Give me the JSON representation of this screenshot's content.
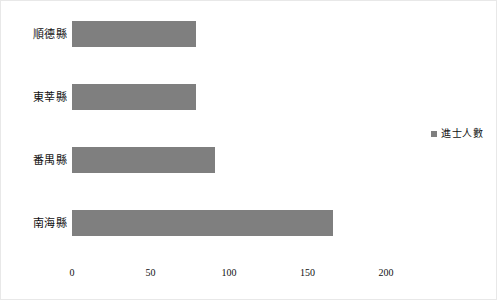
{
  "chart_data": {
    "type": "bar",
    "orientation": "horizontal",
    "title": "",
    "xlabel": "",
    "ylabel": "",
    "categories": [
      "順德縣",
      "東莘縣",
      "番禺縣",
      "南海縣"
    ],
    "values": [
      79,
      79,
      91,
      166
    ],
    "series": [
      {
        "name": "進士人數",
        "values": [
          79,
          79,
          91,
          166
        ],
        "color": "#7f7f7f"
      }
    ],
    "xlim": [
      0,
      200
    ],
    "xticks": [
      0,
      50,
      100,
      150,
      200
    ],
    "xtick_labels": [
      "0",
      "50",
      "100",
      "150",
      "200"
    ],
    "grid": false,
    "legend": {
      "position": "right",
      "entries": [
        {
          "label": "進士人數",
          "color": "#7f7f7f",
          "marker": "square-marker"
        }
      ]
    },
    "bar_color": "#7f7f7f",
    "background_color": "#ffffff",
    "border_color": "#e8e8e8"
  },
  "axis": {
    "ticks": [
      {
        "label": "0",
        "value": 0
      },
      {
        "label": "50",
        "value": 50
      },
      {
        "label": "100",
        "value": 100
      },
      {
        "label": "150",
        "value": 150
      },
      {
        "label": "200",
        "value": 200
      }
    ]
  },
  "bars": [
    {
      "label": "順德縣",
      "value": 79
    },
    {
      "label": "東莘縣",
      "value": 79
    },
    {
      "label": "番禺縣",
      "value": 91
    },
    {
      "label": "南海縣",
      "value": 166
    }
  ],
  "legend": {
    "label": "進士人數"
  }
}
